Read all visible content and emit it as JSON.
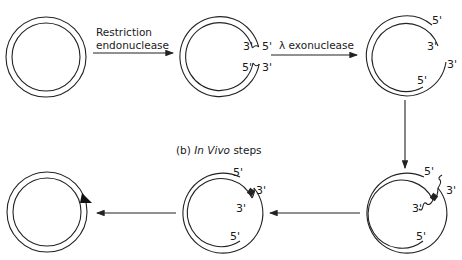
{
  "diagram": {
    "section_b_label": {
      "prefix": "(b)",
      "italic": "In Vivo",
      "suffix": "steps"
    },
    "steps": [
      {
        "id": "intact-plasmid",
        "labels": []
      },
      {
        "id": "cut-plasmid",
        "labels": [
          "3'",
          "5'",
          "5'",
          "3'"
        ]
      },
      {
        "id": "resected-plasmid",
        "labels": [
          "5'",
          "3'",
          "3'",
          "5'"
        ]
      },
      {
        "id": "annealed-with-flap",
        "labels": [
          "5'",
          "3'",
          "3'",
          "5'"
        ]
      },
      {
        "id": "repaired-gap",
        "labels": [
          "5'",
          "3'",
          "3'",
          "5'"
        ]
      },
      {
        "id": "final-plasmid-with-marker",
        "labels": []
      }
    ],
    "arrows": [
      {
        "id": "arrow-restriction",
        "label_line1": "Restriction",
        "label_line2": "endonuclease"
      },
      {
        "id": "arrow-exonuclease",
        "label": "λ exonuclease"
      },
      {
        "id": "arrow-down",
        "label": ""
      },
      {
        "id": "arrow-left-1",
        "label": ""
      },
      {
        "id": "arrow-left-2",
        "label": ""
      }
    ],
    "colors": {
      "stroke": "#222222",
      "background": "#ffffff"
    }
  }
}
